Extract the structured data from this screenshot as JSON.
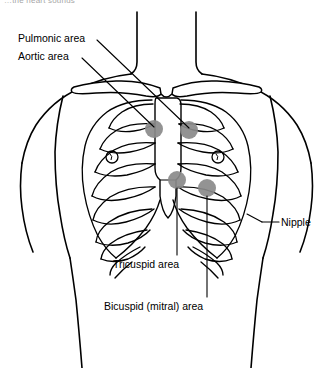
{
  "figure": {
    "title_partial": "…the heart sounds",
    "ink_color": "#000000",
    "background_color": "#ffffff",
    "auscultation_fill": "#8a8a8a"
  },
  "labels": {
    "pulmonic": "Pulmonic area",
    "aortic": "Aortic area",
    "tricuspid": "Tricuspid area",
    "bicuspid": "Bicuspid (mitral) area",
    "nipple": "Nipple"
  },
  "auscultation_sites": [
    {
      "name": "pulmonic",
      "cx": 154,
      "cy": 129,
      "r": 9
    },
    {
      "name": "aortic",
      "cx": 189,
      "cy": 130,
      "r": 9
    },
    {
      "name": "tricuspid",
      "cx": 177,
      "cy": 180,
      "r": 9
    },
    {
      "name": "bicuspid",
      "cx": 207,
      "cy": 188,
      "r": 9
    }
  ],
  "nipple_markers": [
    {
      "side": "left",
      "cx": 112,
      "cy": 157,
      "r": 6
    },
    {
      "side": "right",
      "cx": 218,
      "cy": 157,
      "r": 6
    }
  ]
}
